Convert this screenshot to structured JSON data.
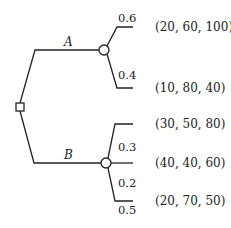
{
  "diagram": {
    "type": "decision-tree",
    "decision_node": {
      "shape": "square"
    },
    "branches": [
      {
        "label": "A",
        "chance_node": {
          "shape": "circle"
        },
        "outcomes": [
          {
            "probability": "0.6",
            "payoff": "(20, 60, 100)"
          },
          {
            "probability": "0.4",
            "payoff": "(10, 80, 40)"
          }
        ]
      },
      {
        "label": "B",
        "chance_node": {
          "shape": "circle"
        },
        "outcomes": [
          {
            "probability": "0.3",
            "payoff": "(30, 50, 80)"
          },
          {
            "probability": "0.2",
            "payoff": "(40, 40, 60)"
          },
          {
            "probability": "0.5",
            "payoff": "(20, 70, 50)"
          }
        ]
      }
    ]
  }
}
